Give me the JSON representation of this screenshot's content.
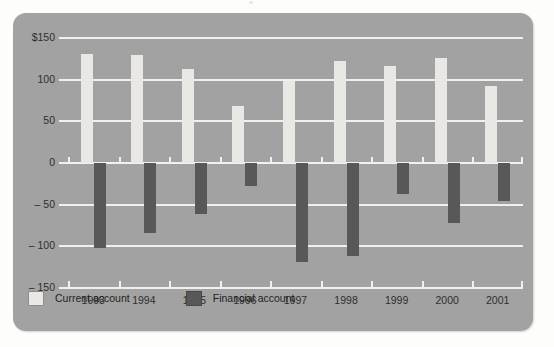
{
  "chart_data": {
    "type": "bar",
    "title": "",
    "subtitle": "",
    "xlabel": "",
    "ylabel": "",
    "categories": [
      "1993",
      "1994",
      "1995",
      "1996",
      "1997",
      "1998",
      "1999",
      "2000",
      "2001"
    ],
    "series": [
      {
        "name": "Current account",
        "color": "#e9e8e5",
        "values": [
          131,
          130,
          113,
          68,
          98,
          122,
          117,
          126,
          92
        ]
      },
      {
        "name": "Financial account",
        "color": "#585858",
        "values": [
          -102,
          -84,
          -61,
          -27,
          -119,
          -112,
          -37,
          -72,
          -46
        ]
      }
    ],
    "ylim": [
      -150,
      150
    ],
    "yticks": [
      150,
      100,
      50,
      0,
      -50,
      -100,
      -150
    ],
    "ytick_labels": [
      "$150",
      "100",
      "50",
      "0",
      "– 50",
      "– 100",
      "– 150"
    ],
    "grid": true,
    "gridlines_at": [
      150,
      100,
      50,
      0,
      -50,
      -100,
      -150
    ],
    "legend_position": "bottom-left",
    "legend_entries": [
      "Current account",
      "Financial account"
    ],
    "annotations": [],
    "colors": {
      "panel_background": "#a2a2a2",
      "figure_background": "#fdfdfc",
      "gridline": "#f1f0ee",
      "text": "#2e2e2e",
      "current_account": "#e9e8e5",
      "financial_account": "#585858"
    }
  },
  "legend": {
    "items": [
      {
        "label": "Current account",
        "swatch": "current"
      },
      {
        "label": "Financial account",
        "swatch": "financial"
      }
    ]
  }
}
